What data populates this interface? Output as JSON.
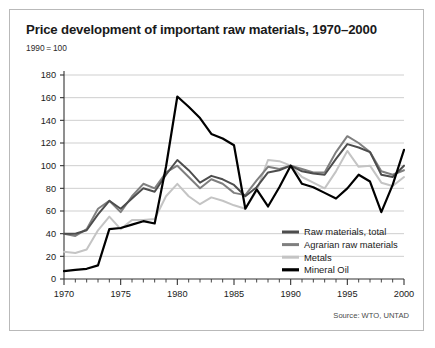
{
  "card": {
    "title": "Price development of important raw materials, 1970–2000",
    "subtitle": "1990 = 100",
    "source": "Source: WTO, UNTAD"
  },
  "colors": {
    "raw_materials_total": "#4d4d4d",
    "agrarian_raw_materials": "#7f7f7f",
    "metals": "#c4c4c4",
    "mineral_oil": "#000000",
    "gridline": "#c9c9c9",
    "axis": "#333333",
    "border": "#b9b9b9",
    "background": "#ffffff"
  },
  "chart_data": {
    "type": "line",
    "title": "Price development of important raw materials, 1970–2000",
    "subtitle": "1990 = 100",
    "xlabel": "",
    "ylabel": "",
    "xlim": [
      1970,
      2000
    ],
    "ylim": [
      0,
      180
    ],
    "ytick_step": 20,
    "yticks": [
      0,
      20,
      40,
      60,
      80,
      100,
      120,
      140,
      160,
      180
    ],
    "xticks": [
      1970,
      1975,
      1980,
      1985,
      1990,
      1995,
      2000
    ],
    "xtick_labels": [
      "1970",
      "1975",
      "1980",
      "1985",
      "1990",
      "1995",
      "2000"
    ],
    "ytick_labels": [
      "0",
      "20",
      "40",
      "60",
      "80",
      "100",
      "120",
      "140",
      "160",
      "180"
    ],
    "minor_xticks_every": 1,
    "grid": "horizontal",
    "legend_position": "inside-bottom-right",
    "x": [
      1970,
      1971,
      1972,
      1973,
      1974,
      1975,
      1976,
      1977,
      1978,
      1979,
      1980,
      1981,
      1982,
      1983,
      1984,
      1985,
      1986,
      1987,
      1988,
      1989,
      1990,
      1991,
      1992,
      1993,
      1994,
      1995,
      1996,
      1997,
      1998,
      1999,
      2000
    ],
    "series": [
      {
        "name": "Raw materials, total",
        "color": "#4d4d4d",
        "values": [
          40,
          40,
          43,
          57,
          69,
          62,
          71,
          80,
          77,
          92,
          105,
          96,
          85,
          91,
          88,
          83,
          73,
          81,
          94,
          96,
          100,
          95,
          93,
          92,
          106,
          119,
          116,
          112,
          92,
          90,
          100
        ]
      },
      {
        "name": "Agrarian raw materials",
        "color": "#7f7f7f",
        "values": [
          40,
          38,
          44,
          62,
          69,
          59,
          73,
          84,
          80,
          94,
          100,
          90,
          80,
          88,
          84,
          76,
          74,
          87,
          99,
          97,
          100,
          97,
          94,
          94,
          112,
          126,
          120,
          112,
          95,
          92,
          96
        ]
      },
      {
        "name": "Metals",
        "color": "#c4c4c4",
        "values": [
          24,
          23,
          26,
          43,
          55,
          44,
          52,
          52,
          53,
          73,
          84,
          73,
          66,
          72,
          69,
          65,
          62,
          78,
          105,
          104,
          100,
          90,
          85,
          80,
          95,
          113,
          99,
          100,
          85,
          82,
          90
        ]
      },
      {
        "name": "Mineral Oil",
        "color": "#000000",
        "values": [
          7,
          8,
          9,
          12,
          44,
          45,
          48,
          51,
          49,
          99,
          161,
          152,
          142,
          128,
          124,
          118,
          62,
          79,
          64,
          81,
          100,
          84,
          81,
          76,
          71,
          80,
          92,
          86,
          59,
          83,
          114
        ]
      }
    ]
  }
}
